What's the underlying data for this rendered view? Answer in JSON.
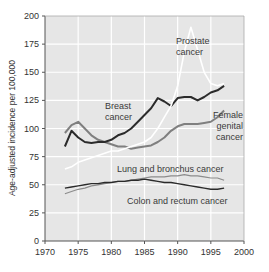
{
  "chart_data": {
    "type": "line",
    "title": "",
    "xlabel": "",
    "ylabel": "Age-adjusted incidence per 100,000",
    "xlim": [
      1970,
      2000
    ],
    "ylim": [
      0,
      200
    ],
    "xticks": [
      1970,
      1975,
      1980,
      1985,
      1990,
      1995,
      2000
    ],
    "yticks": [
      0,
      25,
      50,
      75,
      100,
      125,
      150,
      175,
      200
    ],
    "grid": true,
    "legend": "none (inline annotations)",
    "colors": {
      "plot_bg": "#e6e6e6",
      "grid": "#ffffff",
      "axis": "#555555"
    },
    "x": [
      1973,
      1974,
      1975,
      1976,
      1977,
      1978,
      1979,
      1980,
      1981,
      1982,
      1983,
      1984,
      1985,
      1986,
      1987,
      1988,
      1989,
      1990,
      1991,
      1992,
      1993,
      1994,
      1995,
      1996,
      1997
    ],
    "series": [
      {
        "name": "Prostate cancer",
        "annotation": [
          "Prostate",
          "cancer"
        ],
        "color": "#ffffff",
        "values": [
          64,
          66,
          70,
          72,
          74,
          76,
          78,
          80,
          80,
          82,
          84,
          86,
          88,
          92,
          100,
          110,
          120,
          138,
          168,
          190,
          170,
          150,
          140,
          138,
          140
        ]
      },
      {
        "name": "Breast cancer",
        "annotation": [
          "Breast",
          "cancer"
        ],
        "color": "#2b2b2b",
        "values": [
          84,
          98,
          92,
          88,
          87,
          88,
          88,
          90,
          94,
          96,
          100,
          106,
          112,
          118,
          127,
          124,
          120,
          127,
          128,
          128,
          125,
          128,
          132,
          134,
          138
        ]
      },
      {
        "name": "Female genital cancer",
        "annotation": [
          "Female",
          "genital",
          "cancer"
        ],
        "color": "#7f7f7f",
        "values": [
          96,
          103,
          106,
          100,
          94,
          90,
          88,
          86,
          84,
          84,
          82,
          83,
          84,
          85,
          88,
          92,
          98,
          102,
          104,
          104,
          104,
          105,
          106,
          110,
          116
        ]
      },
      {
        "name": "Lung and bronchus cancer",
        "annotation": [
          "Lung and bronchus cancer"
        ],
        "color": "#8c8c8c",
        "values": [
          42,
          44,
          46,
          47,
          49,
          50,
          51,
          52,
          53,
          53,
          54,
          55,
          56,
          57,
          57,
          57,
          58,
          58,
          59,
          58,
          58,
          57,
          56,
          56,
          54
        ]
      },
      {
        "name": "Colon and rectum cancer",
        "annotation": [
          "Colon and rectum cancer"
        ],
        "color": "#2b2b2b",
        "values": [
          47,
          48,
          49,
          50,
          51,
          51,
          52,
          52,
          53,
          53,
          54,
          54,
          55,
          54,
          53,
          52,
          52,
          51,
          50,
          49,
          48,
          47,
          46,
          46,
          47
        ]
      }
    ]
  }
}
